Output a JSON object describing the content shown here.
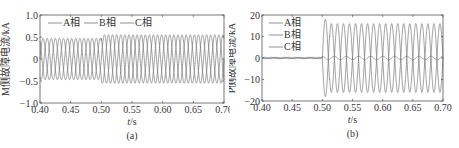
{
  "chart_data": [
    {
      "type": "line",
      "panel_label": "(a)",
      "title": "",
      "xlabel": "t/s",
      "ylabel": "M侧故障电流/kA",
      "xlim": [
        0.4,
        0.7
      ],
      "ylim": [
        -1.0,
        1.0
      ],
      "xticks": [
        "0.40",
        "0.45",
        "0.50",
        "0.55",
        "0.60",
        "0.65",
        "0.70"
      ],
      "yticks": [
        "1.0",
        "0.5",
        "0",
        "-0.5",
        "-1.0"
      ],
      "grid": false,
      "legend_position": "top, horizontal",
      "legend": [
        "A相",
        "B相",
        "C相"
      ],
      "frequency_hz": 50,
      "fault_time": 0.5,
      "series": [
        {
          "name": "A相",
          "amplitude_before": 0.47,
          "amplitude_after": 0.55,
          "phase_deg": 0
        },
        {
          "name": "B相",
          "amplitude_before": 0.47,
          "amplitude_after": 0.55,
          "phase_deg": -120
        },
        {
          "name": "C相",
          "amplitude_before": 0.47,
          "amplitude_after": 0.55,
          "phase_deg": 120
        }
      ]
    },
    {
      "type": "line",
      "panel_label": "(b)",
      "title": "",
      "xlabel": "t/s",
      "ylabel": "P侧故障电流/kA",
      "xlim": [
        0.4,
        0.7
      ],
      "ylim": [
        -20,
        20
      ],
      "xticks": [
        "0.40",
        "0.45",
        "0.50",
        "0.55",
        "0.60",
        "0.65",
        "0.70"
      ],
      "yticks": [
        "20",
        "10",
        "0",
        "-10",
        "-20"
      ],
      "grid": false,
      "legend_position": "upper left, vertical",
      "legend": [
        "A相",
        "B相",
        "C相"
      ],
      "frequency_hz": 50,
      "fault_time": 0.5,
      "series": [
        {
          "name": "A相",
          "amplitude_before": 0.3,
          "amplitude_after": 16,
          "peak_first": 18,
          "phase_deg": 0
        },
        {
          "name": "B相",
          "amplitude_before": 0.3,
          "amplitude_after": 16,
          "peak_first": 18,
          "phase_deg": 180
        },
        {
          "name": "C相",
          "amplitude_before": 0.3,
          "amplitude_after": 0.8,
          "phase_deg": 90
        }
      ]
    }
  ]
}
